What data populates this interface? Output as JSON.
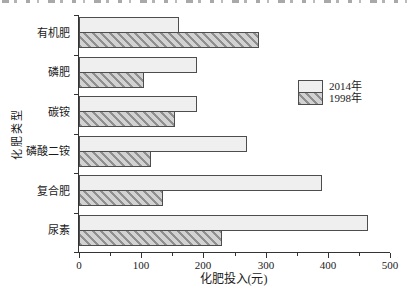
{
  "chart_data": {
    "type": "bar",
    "orientation": "horizontal",
    "xlabel": "化肥投入(元)",
    "ylabel": "化肥类型",
    "categories": [
      "有机肥",
      "磷肥",
      "碳铵",
      "磷酸二铵",
      "复合肥",
      "尿素"
    ],
    "series": [
      {
        "name": "2014年",
        "values": [
          160,
          190,
          190,
          270,
          390,
          465
        ]
      },
      {
        "name": "1998年",
        "values": [
          290,
          105,
          155,
          115,
          135,
          230
        ]
      }
    ],
    "xlim": [
      0,
      500
    ],
    "xticks": [
      0,
      100,
      200,
      300,
      400,
      500
    ],
    "xticks_minor": [
      50,
      150,
      250,
      350,
      450
    ],
    "legend": {
      "position": "right",
      "entries": [
        "2014年",
        "1998年"
      ]
    },
    "grid": false,
    "colors": {
      "bar_2014_fill": "#efefef",
      "bar_1998_background": "#d2d2d2",
      "bar_1998_stripe": "#8f8f8f",
      "bar_border": "#4d4d4d",
      "axis_line": "#333333",
      "text": "#1a1a1a"
    }
  }
}
